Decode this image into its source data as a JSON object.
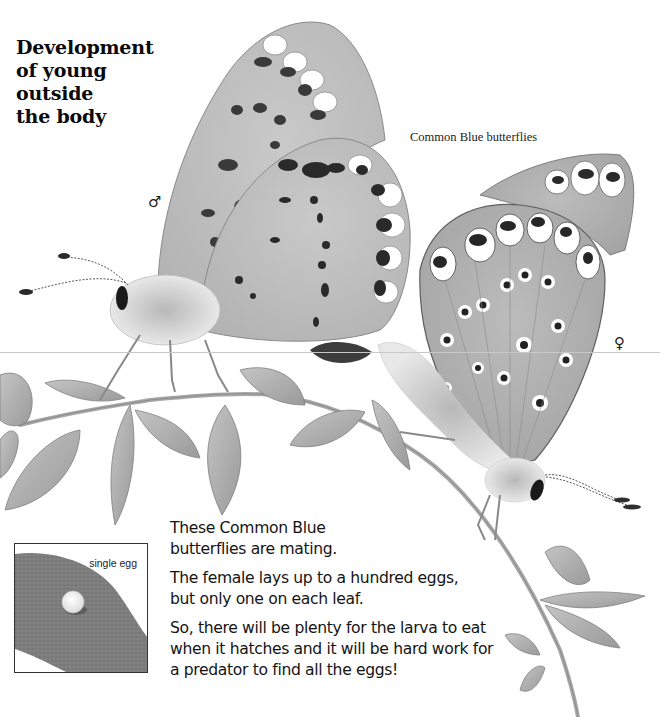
{
  "page": {
    "title_lines": [
      "Development",
      "of young",
      "outside",
      "the body"
    ],
    "figure_caption": "Common Blue butterflies",
    "male_symbol": "♂",
    "female_symbol": "♀",
    "paragraphs": [
      "These Common Blue butterflies are mating.",
      "The female lays up to a hundred eggs, but only one on each leaf.",
      "So, there will be plenty for the larva to eat when it hatches and it will be hard work for a predator to find all the eggs!"
    ],
    "inset": {
      "label": "single egg"
    }
  },
  "colors": {
    "wing_gray": "#bdbdbd",
    "leaf_gray": "#a9a9a9",
    "spot_black": "#1a1a1a",
    "text": "#111111"
  }
}
